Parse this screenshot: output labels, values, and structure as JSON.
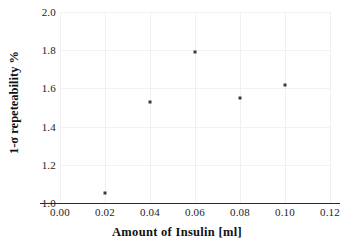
{
  "chart_data": {
    "type": "scatter",
    "title": "",
    "xlabel": "Amount of Insulin [ml]",
    "ylabel": "1-σ repeteability %",
    "xlim": [
      0.0,
      0.12
    ],
    "ylim": [
      1.0,
      2.0
    ],
    "grid": true,
    "legend": "none",
    "marker": "square",
    "marker_color": "#3a3a3a",
    "xticks": [
      "0.00",
      "0.02",
      "0.04",
      "0.06",
      "0.08",
      "0.10",
      "0.12"
    ],
    "xtick_values": [
      0.0,
      0.02,
      0.04,
      0.06,
      0.08,
      0.1,
      0.12
    ],
    "yticks": [
      "2.0",
      "1.8",
      "1.6",
      "1.4",
      "1.2",
      "1.0"
    ],
    "ytick_values": [
      2.0,
      1.8,
      1.6,
      1.4,
      1.2,
      1.0
    ],
    "x": [
      0.02,
      0.04,
      0.06,
      0.08,
      0.1
    ],
    "y": [
      1.05,
      1.53,
      1.79,
      1.55,
      1.62
    ],
    "points": [
      {
        "x": 0.02,
        "y": 1.05
      },
      {
        "x": 0.04,
        "y": 1.53
      },
      {
        "x": 0.06,
        "y": 1.79
      },
      {
        "x": 0.08,
        "y": 1.55
      },
      {
        "x": 0.1,
        "y": 1.62
      }
    ]
  }
}
